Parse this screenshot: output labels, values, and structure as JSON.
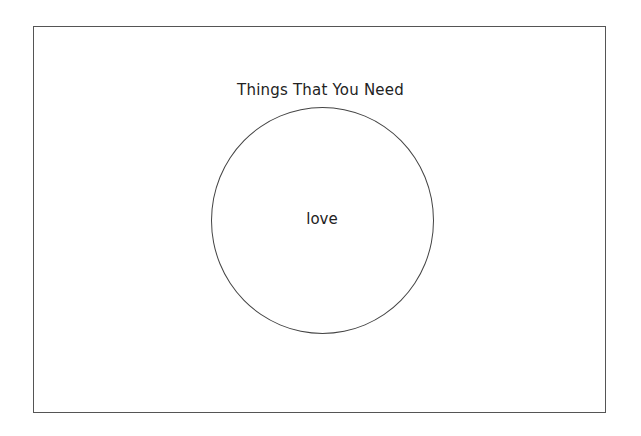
{
  "diagram": {
    "type": "venn",
    "title": "Things That You Need",
    "sets": [
      {
        "label": "love"
      }
    ],
    "colors": {
      "border": "#555555",
      "circle_stroke": "#444444",
      "text": "#222222",
      "background": "#ffffff"
    }
  }
}
